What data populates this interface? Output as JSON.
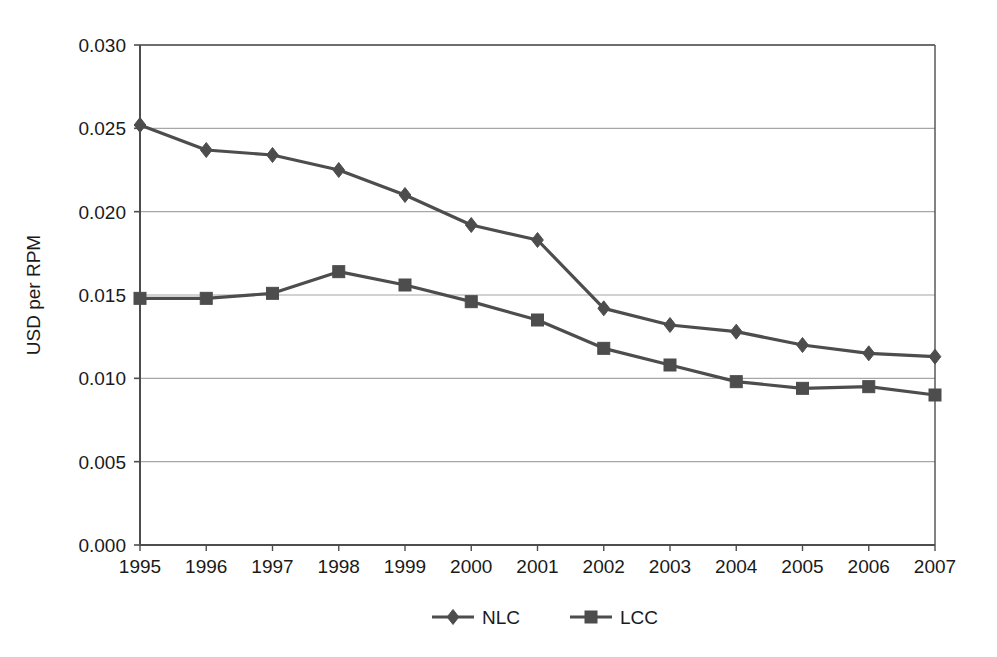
{
  "chart_data": {
    "type": "line",
    "title": "",
    "subtitle": "",
    "xlabel": "",
    "ylabel": "USD per RPM",
    "categories": [
      "1995",
      "1996",
      "1997",
      "1998",
      "1999",
      "2000",
      "2001",
      "2002",
      "2003",
      "2004",
      "2005",
      "2006",
      "2007"
    ],
    "x": [
      1995,
      1996,
      1997,
      1998,
      1999,
      2000,
      2001,
      2002,
      2003,
      2004,
      2005,
      2006,
      2007
    ],
    "series": [
      {
        "name": "NLC",
        "marker": "diamond",
        "color": "#4d4d4d",
        "values": [
          0.0252,
          0.0237,
          0.0234,
          0.0225,
          0.021,
          0.0192,
          0.0183,
          0.0142,
          0.0132,
          0.0128,
          0.012,
          0.0115,
          0.0113
        ]
      },
      {
        "name": "LCC",
        "marker": "square",
        "color": "#4d4d4d",
        "values": [
          0.0148,
          0.0148,
          0.0151,
          0.0164,
          0.0156,
          0.0146,
          0.0135,
          0.0118,
          0.0108,
          0.0098,
          0.0094,
          0.0095,
          0.009
        ]
      }
    ],
    "ylim": [
      0.0,
      0.03
    ],
    "yticks": [
      0.0,
      0.005,
      0.01,
      0.015,
      0.02,
      0.025,
      0.03
    ],
    "ytick_labels": [
      "0.000",
      "0.005",
      "0.010",
      "0.015",
      "0.020",
      "0.025",
      "0.030"
    ],
    "grid": {
      "horizontal": true,
      "vertical": false,
      "color": "#a6a6a6"
    },
    "legend": {
      "position": "bottom",
      "entries": [
        {
          "label": "NLC",
          "marker": "diamond",
          "color": "#4d4d4d"
        },
        {
          "label": "LCC",
          "marker": "square",
          "color": "#4d4d4d"
        }
      ]
    },
    "plot_frame": {
      "border_color": "#4d4d4d",
      "background": "#ffffff"
    }
  }
}
